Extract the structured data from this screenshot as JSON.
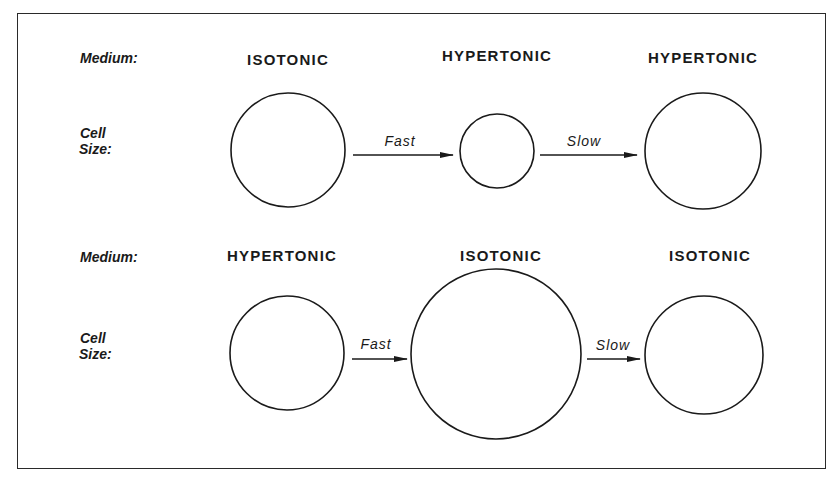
{
  "diagram": {
    "rows": [
      {
        "medium_label": "Medium:",
        "cell_size_label_line1": "Cell",
        "cell_size_label_line2": "Size:",
        "stages": [
          {
            "medium": "ISOTONIC",
            "cell_size": "normal"
          },
          {
            "medium": "HYPERTONIC",
            "cell_size": "shrunken"
          },
          {
            "medium": "HYPERTONIC",
            "cell_size": "normal"
          }
        ],
        "transitions": [
          {
            "label": "Fast"
          },
          {
            "label": "Slow"
          }
        ]
      },
      {
        "medium_label": "Medium:",
        "cell_size_label_line1": "Cell",
        "cell_size_label_line2": "Size:",
        "stages": [
          {
            "medium": "HYPERTONIC",
            "cell_size": "normal"
          },
          {
            "medium": "ISOTONIC",
            "cell_size": "swollen"
          },
          {
            "medium": "ISOTONIC",
            "cell_size": "normal"
          }
        ],
        "transitions": [
          {
            "label": "Fast"
          },
          {
            "label": "Slow"
          }
        ]
      }
    ]
  },
  "colors": {
    "ink": "#1a1a1a",
    "background": "#ffffff"
  }
}
